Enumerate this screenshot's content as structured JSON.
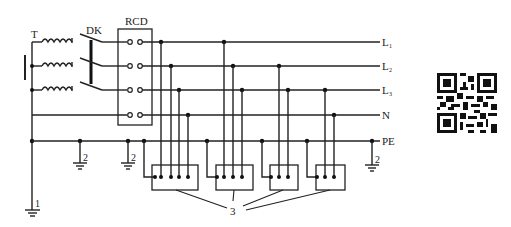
{
  "diagram": {
    "labels": {
      "transformer": "T",
      "switch": "DK",
      "rcd": "RCD",
      "L1_main": "L",
      "L1_sub": "1",
      "L2_main": "L",
      "L2_sub": "2",
      "L3_main": "L",
      "L3_sub": "3",
      "neutral": "N",
      "protective_earth": "PE",
      "ground_1": "1",
      "ground_2a": "2",
      "ground_2b": "2",
      "ground_2c": "2",
      "loads": "3"
    },
    "conductors": [
      "L1",
      "L2",
      "L3",
      "N",
      "PE"
    ],
    "loads": [
      {
        "id": "load-1",
        "terminals": 5,
        "connections": [
          "PE",
          "L1",
          "L2",
          "L3",
          "N"
        ]
      },
      {
        "id": "load-2",
        "terminals": 4,
        "connections": [
          "PE",
          "L1",
          "L2",
          "L3"
        ]
      },
      {
        "id": "load-3",
        "terminals": 3,
        "connections": [
          "PE",
          "L2",
          "L3"
        ]
      },
      {
        "id": "load-4",
        "terminals": 3,
        "connections": [
          "PE",
          "L3",
          "N"
        ]
      }
    ],
    "legend": {
      "1": "working (system) grounding",
      "2": "repeated grounding",
      "3": "electrical equipment"
    }
  },
  "qr_code": {
    "icon": "qr-code-icon"
  }
}
